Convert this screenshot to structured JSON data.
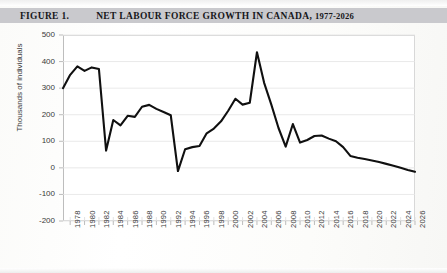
{
  "figure": {
    "number_label": "FIGURE 1.",
    "title": "NET LABOUR FORCE GROWTH IN CANADA,",
    "title_years": "1977-2026",
    "footnote": ""
  },
  "chart_data": {
    "type": "line",
    "title": "NET LABOUR FORCE GROWTH IN CANADA, 1977-2026",
    "xlabel": "",
    "ylabel": "Thousands of individuals",
    "ylim": [
      -200,
      500
    ],
    "xlim": [
      1977,
      2026
    ],
    "ytick_step": 100,
    "yticks": [
      500,
      400,
      300,
      200,
      100,
      0,
      -100,
      -200
    ],
    "ytick_labels": [
      "500",
      "400",
      "300",
      "200",
      "100",
      "0",
      "-100",
      "-200"
    ],
    "xticks": [
      1978,
      1980,
      1982,
      1984,
      1986,
      1988,
      1990,
      1992,
      1994,
      1996,
      1998,
      2000,
      2002,
      2004,
      2006,
      2008,
      2010,
      2012,
      2014,
      2016,
      2018,
      2020,
      2022,
      2024,
      2026
    ],
    "xtick_labels": [
      "1978",
      "1980",
      "1982",
      "1984",
      "1986",
      "1988",
      "1990",
      "1992",
      "1994",
      "1996",
      "1998",
      "2000",
      "2002",
      "2004",
      "2006",
      "2008",
      "2010",
      "2012",
      "2014",
      "2016",
      "2018",
      "2020",
      "2022",
      "2024",
      "2026"
    ],
    "xtick_rotation": 90,
    "grid": true,
    "grid_color": "#e3e3e3",
    "line_color": "#101010",
    "line_width": 2.1,
    "legend": false,
    "series": [
      {
        "name": "Net labour force growth",
        "x": [
          1977,
          1978,
          1979,
          1980,
          1981,
          1982,
          1983,
          1984,
          1985,
          1986,
          1987,
          1988,
          1989,
          1990,
          1991,
          1992,
          1993,
          1994,
          1995,
          1996,
          1997,
          1998,
          1999,
          2000,
          2001,
          2002,
          2003,
          2004,
          2005,
          2006,
          2007,
          2008,
          2009,
          2010,
          2011,
          2012,
          2013,
          2014,
          2015,
          2016,
          2017,
          2018,
          2019,
          2020,
          2021,
          2022,
          2023,
          2024,
          2025,
          2026
        ],
        "values": [
          300,
          350,
          382,
          365,
          378,
          372,
          65,
          180,
          160,
          196,
          192,
          230,
          237,
          222,
          210,
          198,
          -12,
          70,
          78,
          82,
          130,
          148,
          175,
          215,
          260,
          238,
          245,
          435,
          320,
          238,
          150,
          80,
          165,
          95,
          105,
          120,
          122,
          110,
          100,
          78,
          45,
          38,
          33,
          28,
          22,
          15,
          8,
          0,
          -8,
          -15
        ]
      }
    ]
  }
}
